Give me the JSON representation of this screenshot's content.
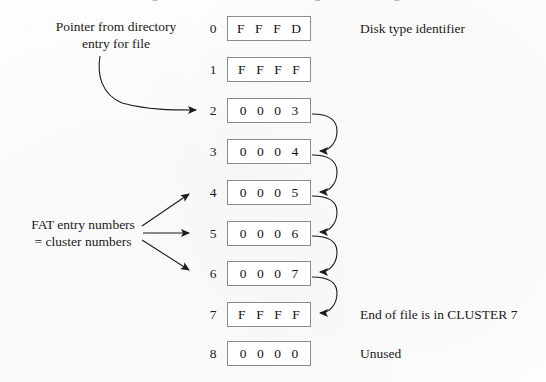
{
  "figure": {
    "title_cut_off": "Figure 2.5  A FAT chain showing cluster linkage",
    "background_color": "#fdfdfd",
    "ink_color": "#1b1b1b",
    "box_border_color": "#8b8b8b"
  },
  "fat_table": {
    "rows": [
      {
        "index": "0",
        "value": "F F F D"
      },
      {
        "index": "1",
        "value": "F F F F"
      },
      {
        "index": "2",
        "value": "0 0 0 3"
      },
      {
        "index": "3",
        "value": "0 0 0 4"
      },
      {
        "index": "4",
        "value": "0 0 0 5"
      },
      {
        "index": "5",
        "value": "0 0 0 6"
      },
      {
        "index": "6",
        "value": "0 0 0 7"
      },
      {
        "index": "7",
        "value": "F F F F"
      },
      {
        "index": "8",
        "value": "0 0 0 0"
      }
    ]
  },
  "annotations": {
    "pointer_note": {
      "line1": "Pointer from directory",
      "line2": "entry for file",
      "target_row": "2"
    },
    "fat_entry_note": {
      "line1": "FAT entry numbers",
      "line2": "= cluster numbers",
      "target_rows": [
        "4",
        "5",
        "6"
      ]
    },
    "disk_type": {
      "text": "Disk type identifier",
      "row": "0"
    },
    "end_of_file": {
      "text": "End of file is in CLUSTER 7",
      "row": "7"
    },
    "unused": {
      "text": "Unused",
      "row": "8"
    }
  },
  "chain_links": [
    {
      "from_row": "2",
      "to_row": "3"
    },
    {
      "from_row": "3",
      "to_row": "4"
    },
    {
      "from_row": "4",
      "to_row": "5"
    },
    {
      "from_row": "5",
      "to_row": "6"
    },
    {
      "from_row": "6",
      "to_row": "7"
    }
  ]
}
